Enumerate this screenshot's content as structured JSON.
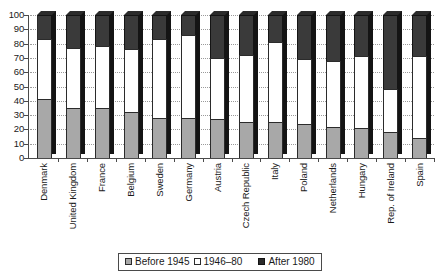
{
  "chart_data": {
    "type": "bar",
    "subtype": "stacked-bar-100-percent",
    "title": "",
    "xlabel": "",
    "ylabel": "",
    "ylim": [
      0,
      100
    ],
    "yticks": [
      0,
      10,
      20,
      30,
      40,
      50,
      60,
      70,
      80,
      90,
      100
    ],
    "grid": true,
    "grid_style": "dotted horizontal",
    "legend_position": "bottom-center",
    "categories": [
      "Denmark",
      "United Kingdom",
      "France",
      "Belgium",
      "Sweden",
      "Germany",
      "Austria",
      "Czech Republic",
      "Italy",
      "Poland",
      "Netherlands",
      "Hungary",
      "Rep. of Ireland",
      "Spain"
    ],
    "series": [
      {
        "name": "Before 1945",
        "color": "#a8a8a8",
        "values": [
          41,
          35,
          35,
          32,
          28,
          28,
          27,
          25,
          25,
          24,
          22,
          21,
          18,
          14
        ]
      },
      {
        "name": "1946–80",
        "color": "#ffffff",
        "values": [
          42,
          42,
          43,
          44,
          55,
          58,
          43,
          47,
          56,
          45,
          46,
          50,
          30,
          57
        ]
      },
      {
        "name": "After 1980",
        "color": "#2b2b2b",
        "values": [
          17,
          23,
          22,
          24,
          17,
          14,
          30,
          28,
          19,
          31,
          32,
          29,
          52,
          29
        ]
      }
    ],
    "cumulative_tops": {
      "after_first_segment": [
        41,
        35,
        35,
        32,
        28,
        28,
        27,
        25,
        25,
        24,
        22,
        21,
        18,
        14
      ],
      "after_second_segment": [
        83,
        77,
        78,
        76,
        83,
        86,
        70,
        72,
        81,
        69,
        68,
        71,
        48,
        71
      ]
    }
  },
  "legend": {
    "items": [
      {
        "label": "Before 1945",
        "icon": "legend-swatch-gray"
      },
      {
        "label": "1946–80",
        "icon": "legend-swatch-white"
      },
      {
        "label": "After 1980",
        "icon": "legend-swatch-black"
      }
    ]
  }
}
